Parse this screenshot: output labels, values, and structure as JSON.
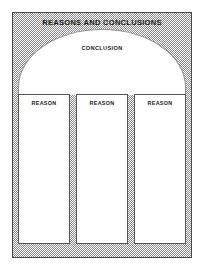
{
  "worksheet": {
    "title": "REASONS AND CONCLUSIONS",
    "conclusion": {
      "label": "CONCLUSION",
      "shape": "arch-icon"
    },
    "reasons": [
      {
        "label": "REASON"
      },
      {
        "label": "REASON"
      },
      {
        "label": "REASON"
      }
    ]
  },
  "colors": {
    "background": "#ffffff",
    "frame_fill_gray": "#8a8a8a",
    "frame_border": "#4a4a4a",
    "panel_fill": "#ffffff",
    "panel_border": "#555555",
    "arch_border": "#8e8e8e",
    "text": "#1a1a1a"
  }
}
